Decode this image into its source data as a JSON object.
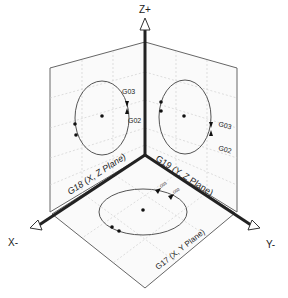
{
  "axes": {
    "z": "Z+",
    "x": "X-",
    "y": "Y-"
  },
  "planes": {
    "xz": {
      "label": "G18 (X, Z Plane)",
      "cw": "G02",
      "ccw": "G03"
    },
    "yz": {
      "label": "G19 (Y, Z Plane)",
      "cw": "G02",
      "ccw": "G03"
    },
    "xy": {
      "label": "G17 (X, Y Plane)",
      "cw": "G02",
      "ccw": "G03"
    }
  },
  "colors": {
    "line": "#555555",
    "axis": "#222222",
    "grid": "#cccccc",
    "background": "#ffffff"
  }
}
